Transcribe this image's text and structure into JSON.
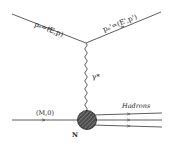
{
  "diagram": {
    "type": "feynman-diagram",
    "labels": {
      "incoming_electron": "pₑ=(E,p)",
      "outgoing_electron": "pₑ'=(E',p')",
      "virtual_photon": "γ*",
      "nucleon_momentum": "(M,0)",
      "nucleon": "N",
      "hadrons": "Hadrons"
    },
    "colors": {
      "line": "#333333",
      "blob_fill": "#555555",
      "background": "#ffffff"
    }
  }
}
